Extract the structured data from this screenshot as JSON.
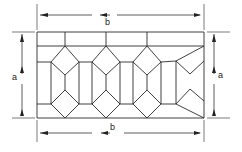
{
  "diagram": {
    "type": "tiling-pattern-with-dimensions",
    "colors": {
      "line": "#2a2a2a",
      "background": "#ffffff"
    },
    "dimensions": {
      "top": {
        "label": "b"
      },
      "bottom": {
        "label": "b"
      },
      "left": {
        "label": "a"
      },
      "right": {
        "label": "a"
      }
    }
  }
}
